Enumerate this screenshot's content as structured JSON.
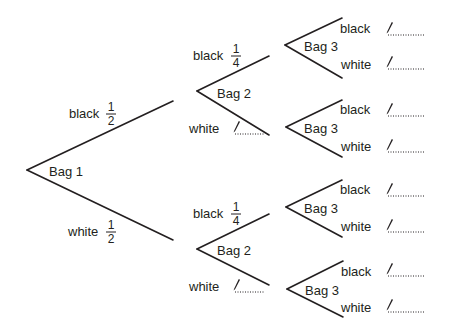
{
  "diagram": {
    "type": "probability-tree",
    "bag1": {
      "label": "Bag 1",
      "branches": [
        {
          "outcome": "black",
          "prob_num": "1",
          "prob_den": "2"
        },
        {
          "outcome": "white",
          "prob_num": "1",
          "prob_den": "2"
        }
      ]
    },
    "bag2_upper": {
      "label": "Bag 2",
      "branches": [
        {
          "outcome": "black",
          "prob_num": "1",
          "prob_den": "4"
        },
        {
          "outcome": "white",
          "answer": ""
        }
      ]
    },
    "bag2_lower": {
      "label": "Bag 2",
      "branches": [
        {
          "outcome": "black",
          "prob_num": "1",
          "prob_den": "4"
        },
        {
          "outcome": "white",
          "answer": ""
        }
      ]
    },
    "bag3": [
      {
        "label": "Bag 3",
        "branches": [
          {
            "outcome": "black",
            "answer": ""
          },
          {
            "outcome": "white",
            "answer": ""
          }
        ]
      },
      {
        "label": "Bag 3",
        "branches": [
          {
            "outcome": "black",
            "answer": ""
          },
          {
            "outcome": "white",
            "answer": ""
          }
        ]
      },
      {
        "label": "Bag 3",
        "branches": [
          {
            "outcome": "black",
            "answer": ""
          },
          {
            "outcome": "white",
            "answer": ""
          }
        ]
      },
      {
        "label": "Bag 3",
        "branches": [
          {
            "outcome": "black",
            "answer": ""
          },
          {
            "outcome": "white",
            "answer": ""
          }
        ]
      }
    ],
    "icons": {
      "answer_field": "pencil-icon"
    },
    "colors": {
      "ink": "#231f20",
      "background": "#ffffff"
    }
  }
}
